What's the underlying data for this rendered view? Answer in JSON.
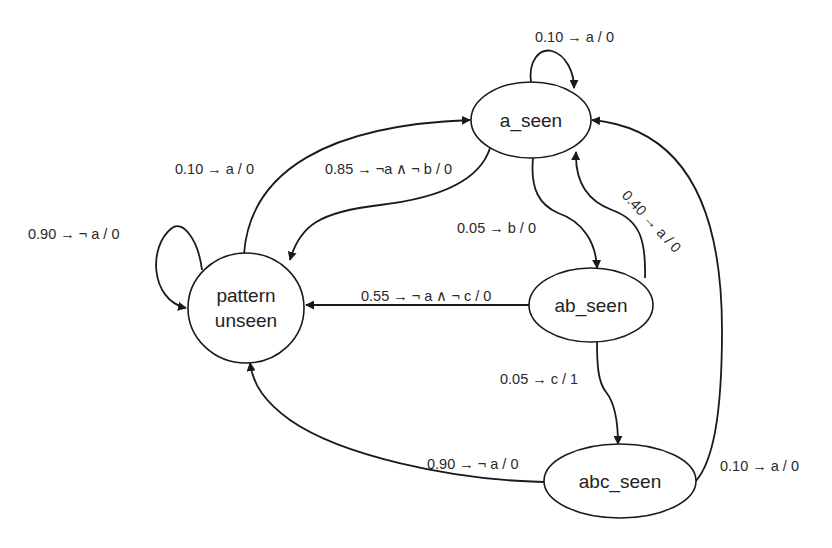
{
  "diagram": {
    "type": "state machine",
    "nodes": [
      {
        "id": "pattern_unseen",
        "label_lines": [
          "pattern",
          "unseen"
        ]
      },
      {
        "id": "a_seen",
        "label": "a_seen"
      },
      {
        "id": "ab_seen",
        "label": "ab_seen"
      },
      {
        "id": "abc_seen",
        "label": "abc_seen"
      }
    ],
    "edges": [
      {
        "from": "pattern_unseen",
        "to": "pattern_unseen",
        "label": "0.90 → ¬ a / 0"
      },
      {
        "from": "pattern_unseen",
        "to": "a_seen",
        "label": "0.10 → a / 0"
      },
      {
        "from": "a_seen",
        "to": "a_seen",
        "label": "0.10 → a / 0"
      },
      {
        "from": "a_seen",
        "to": "pattern_unseen",
        "label": "0.85 → ¬a ∧ ¬ b / 0"
      },
      {
        "from": "a_seen",
        "to": "ab_seen",
        "label": "0.05 → b / 0"
      },
      {
        "from": "ab_seen",
        "to": "a_seen",
        "label": "0.40 → a / 0"
      },
      {
        "from": "ab_seen",
        "to": "pattern_unseen",
        "label": "0.55 → ¬  a ∧ ¬ c / 0"
      },
      {
        "from": "ab_seen",
        "to": "abc_seen",
        "label": "0.05 → c / 1"
      },
      {
        "from": "abc_seen",
        "to": "pattern_unseen",
        "label": "0.90 → ¬ a / 0"
      },
      {
        "from": "abc_seen",
        "to": "a_seen",
        "label": "0.10 → a / 0"
      }
    ]
  }
}
